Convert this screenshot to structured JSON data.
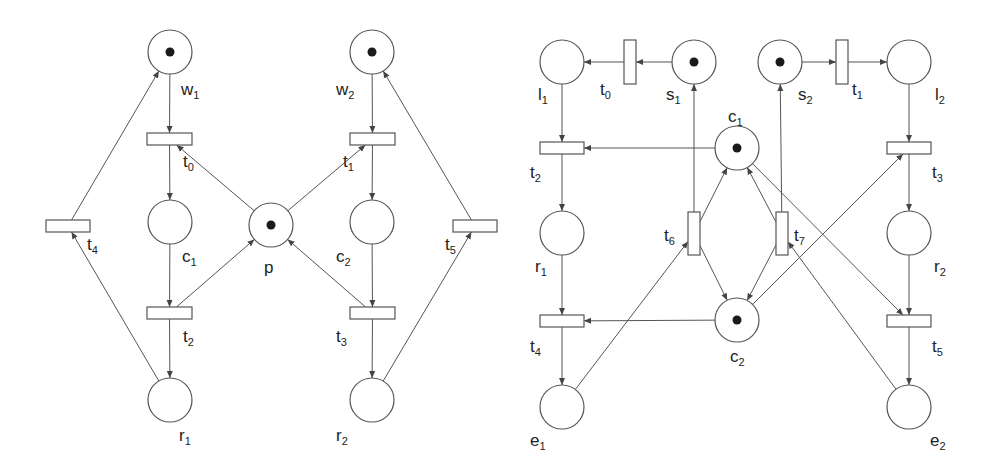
{
  "diagram": {
    "type": "petri-net",
    "colors": {
      "stroke": "#555555",
      "token": "#1a1a1a",
      "background": "#ffffff"
    },
    "nets": [
      {
        "id": "left",
        "places": [
          {
            "id": "w1",
            "base": "w",
            "sub": "1",
            "x": 170,
            "y": 52,
            "tokens": 1,
            "lx": 181,
            "ly": 95
          },
          {
            "id": "w2",
            "base": "w",
            "sub": "2",
            "x": 372,
            "y": 52,
            "tokens": 1,
            "lx": 336,
            "ly": 95
          },
          {
            "id": "c1",
            "base": "c",
            "sub": "1",
            "x": 170,
            "y": 222,
            "tokens": 0,
            "lx": 182,
            "ly": 262
          },
          {
            "id": "p",
            "base": "p",
            "sub": "",
            "x": 271,
            "y": 225,
            "tokens": 1,
            "lx": 264,
            "ly": 273
          },
          {
            "id": "c2",
            "base": "c",
            "sub": "2",
            "x": 372,
            "y": 222,
            "tokens": 0,
            "lx": 336,
            "ly": 262
          },
          {
            "id": "r1",
            "base": "r",
            "sub": "1",
            "x": 170,
            "y": 400,
            "tokens": 0,
            "lx": 179,
            "ly": 441
          },
          {
            "id": "r2",
            "base": "r",
            "sub": "2",
            "x": 372,
            "y": 400,
            "tokens": 0,
            "lx": 336,
            "ly": 441
          }
        ],
        "transitions": [
          {
            "id": "t0",
            "base": "t",
            "sub": "0",
            "x": 147,
            "y": 133,
            "w": 45,
            "h": 12,
            "lx": 183,
            "ly": 167
          },
          {
            "id": "t1",
            "base": "t",
            "sub": "1",
            "x": 350,
            "y": 133,
            "w": 45,
            "h": 12,
            "lx": 343,
            "ly": 167
          },
          {
            "id": "t4",
            "base": "t",
            "sub": "4",
            "x": 46,
            "y": 220,
            "w": 44,
            "h": 12,
            "lx": 87,
            "ly": 250
          },
          {
            "id": "t5",
            "base": "t",
            "sub": "5",
            "x": 453,
            "y": 220,
            "w": 44,
            "h": 12,
            "lx": 445,
            "ly": 250
          },
          {
            "id": "t2",
            "base": "t",
            "sub": "2",
            "x": 147,
            "y": 307,
            "w": 45,
            "h": 12,
            "lx": 183,
            "ly": 342
          },
          {
            "id": "t3",
            "base": "t",
            "sub": "3",
            "x": 350,
            "y": 307,
            "w": 45,
            "h": 12,
            "lx": 336,
            "ly": 342
          }
        ],
        "arcs": [
          {
            "from": "w1",
            "to": "t0"
          },
          {
            "from": "t0",
            "to": "c1"
          },
          {
            "from": "c1",
            "to": "t2"
          },
          {
            "from": "t2",
            "to": "r1"
          },
          {
            "from": "r1",
            "to": "t4"
          },
          {
            "from": "t4",
            "to": "w1"
          },
          {
            "from": "p",
            "to": "t0"
          },
          {
            "from": "t2",
            "to": "p"
          },
          {
            "from": "w2",
            "to": "t1"
          },
          {
            "from": "t1",
            "to": "c2"
          },
          {
            "from": "c2",
            "to": "t3"
          },
          {
            "from": "t3",
            "to": "r2"
          },
          {
            "from": "r2",
            "to": "t5"
          },
          {
            "from": "t5",
            "to": "w2"
          },
          {
            "from": "p",
            "to": "t1"
          },
          {
            "from": "t3",
            "to": "p"
          }
        ]
      },
      {
        "id": "right",
        "places": [
          {
            "id": "l1",
            "base": "l",
            "sub": "1",
            "x": 562,
            "y": 62,
            "tokens": 0,
            "lx": 538,
            "ly": 100
          },
          {
            "id": "s1",
            "base": "s",
            "sub": "1",
            "x": 694,
            "y": 62,
            "tokens": 1,
            "lx": 666,
            "ly": 100
          },
          {
            "id": "s2",
            "base": "s",
            "sub": "2",
            "x": 780,
            "y": 62,
            "tokens": 1,
            "lx": 798,
            "ly": 100
          },
          {
            "id": "l2",
            "base": "l",
            "sub": "2",
            "x": 909,
            "y": 62,
            "tokens": 0,
            "lx": 935,
            "ly": 100
          },
          {
            "id": "c1",
            "base": "c",
            "sub": "1",
            "x": 737,
            "y": 148,
            "tokens": 1,
            "lx": 728,
            "ly": 122
          },
          {
            "id": "r1",
            "base": "r",
            "sub": "1",
            "x": 562,
            "y": 233,
            "tokens": 0,
            "lx": 535,
            "ly": 272
          },
          {
            "id": "r2",
            "base": "r",
            "sub": "2",
            "x": 909,
            "y": 233,
            "tokens": 0,
            "lx": 934,
            "ly": 272
          },
          {
            "id": "c2",
            "base": "c",
            "sub": "2",
            "x": 737,
            "y": 320,
            "tokens": 1,
            "lx": 730,
            "ly": 362
          },
          {
            "id": "e1",
            "base": "e",
            "sub": "1",
            "x": 562,
            "y": 407,
            "tokens": 0,
            "lx": 530,
            "ly": 446
          },
          {
            "id": "e2",
            "base": "e",
            "sub": "2",
            "x": 909,
            "y": 407,
            "tokens": 0,
            "lx": 930,
            "ly": 446
          }
        ],
        "transitions": [
          {
            "id": "t0",
            "base": "t",
            "sub": "0",
            "x": 624,
            "y": 40,
            "w": 12,
            "h": 44,
            "lx": 600,
            "ly": 95
          },
          {
            "id": "t1",
            "base": "t",
            "sub": "1",
            "x": 836,
            "y": 40,
            "w": 12,
            "h": 44,
            "lx": 852,
            "ly": 95
          },
          {
            "id": "t2",
            "base": "t",
            "sub": "2",
            "x": 540,
            "y": 142,
            "w": 44,
            "h": 12,
            "lx": 530,
            "ly": 178
          },
          {
            "id": "t3",
            "base": "t",
            "sub": "3",
            "x": 887,
            "y": 142,
            "w": 44,
            "h": 12,
            "lx": 932,
            "ly": 178
          },
          {
            "id": "t6",
            "base": "t",
            "sub": "6",
            "x": 688,
            "y": 212,
            "w": 12,
            "h": 43,
            "lx": 664,
            "ly": 241
          },
          {
            "id": "t7",
            "base": "t",
            "sub": "7",
            "x": 776,
            "y": 212,
            "w": 12,
            "h": 43,
            "lx": 794,
            "ly": 241
          },
          {
            "id": "t4",
            "base": "t",
            "sub": "4",
            "x": 540,
            "y": 315,
            "w": 44,
            "h": 12,
            "lx": 530,
            "ly": 352
          },
          {
            "id": "t5",
            "base": "t",
            "sub": "5",
            "x": 887,
            "y": 315,
            "w": 44,
            "h": 12,
            "lx": 932,
            "ly": 352
          }
        ],
        "arcs": [
          {
            "from": "s1",
            "to": "t0"
          },
          {
            "from": "t0",
            "to": "l1"
          },
          {
            "from": "s2",
            "to": "t1"
          },
          {
            "from": "t1",
            "to": "l2"
          },
          {
            "from": "l1",
            "to": "t2"
          },
          {
            "from": "t2",
            "to": "r1"
          },
          {
            "from": "r1",
            "to": "t4"
          },
          {
            "from": "t4",
            "to": "e1"
          },
          {
            "from": "l2",
            "to": "t3"
          },
          {
            "from": "t3",
            "to": "r2"
          },
          {
            "from": "r2",
            "to": "t5"
          },
          {
            "from": "t5",
            "to": "e2"
          },
          {
            "from": "c1",
            "to": "t2"
          },
          {
            "from": "c1",
            "to": "t5"
          },
          {
            "from": "c2",
            "to": "t4"
          },
          {
            "from": "c2",
            "to": "t3"
          },
          {
            "from": "t6",
            "to": "s1"
          },
          {
            "from": "t7",
            "to": "s2"
          },
          {
            "from": "t6",
            "to": "c1"
          },
          {
            "from": "t7",
            "to": "c1"
          },
          {
            "from": "t6",
            "to": "c2"
          },
          {
            "from": "t7",
            "to": "c2"
          },
          {
            "from": "e1",
            "to": "t6"
          },
          {
            "from": "e2",
            "to": "t7"
          }
        ]
      }
    ]
  }
}
